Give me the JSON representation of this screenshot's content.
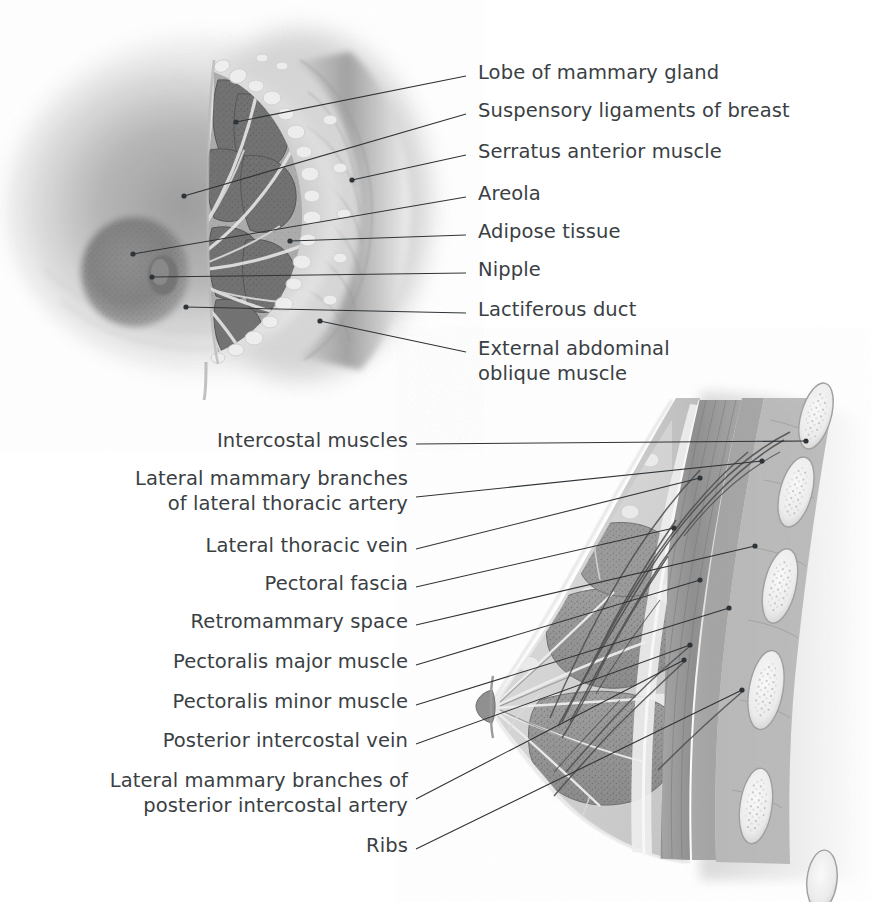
{
  "figure": {
    "style": "grayscale medical illustration",
    "background_color": "#ffffff",
    "text_color": "#3a3f44",
    "leader_color": "#2f3438"
  },
  "panels": [
    {
      "id": "anterior-dissection",
      "name": "Anterior view dissection of the breast",
      "labels": [
        {
          "text": "Lobe of mammary gland",
          "x": 478,
          "y": 60,
          "align": "left",
          "lx": 466,
          "ly": 76,
          "tx": 236,
          "ty": 122
        },
        {
          "text": "Suspensory ligaments of breast",
          "x": 478,
          "y": 98,
          "align": "left",
          "lx": 466,
          "ly": 114,
          "tx": 184,
          "ty": 196
        },
        {
          "text": "Serratus anterior muscle",
          "x": 478,
          "y": 139,
          "align": "left",
          "lx": 466,
          "ly": 155,
          "tx": 352,
          "ty": 180
        },
        {
          "text": "Areola",
          "x": 478,
          "y": 181,
          "align": "left",
          "lx": 466,
          "ly": 197,
          "tx": 133,
          "ty": 254
        },
        {
          "text": "Adipose tissue",
          "x": 478,
          "y": 219,
          "align": "left",
          "lx": 466,
          "ly": 235,
          "tx": 290,
          "ty": 241
        },
        {
          "text": "Nipple",
          "x": 478,
          "y": 257,
          "align": "left",
          "lx": 466,
          "ly": 273,
          "tx": 152,
          "ty": 277
        },
        {
          "text": "Lactiferous duct",
          "x": 478,
          "y": 297,
          "align": "left",
          "lx": 466,
          "ly": 313,
          "tx": 186,
          "ty": 307
        },
        {
          "text": "External abdominal",
          "x": 478,
          "y": 336,
          "align": "left",
          "lx": 466,
          "ly": 352,
          "tx": 320,
          "ty": 321
        },
        {
          "text": "oblique muscle",
          "x": 478,
          "y": 361,
          "align": "left"
        }
      ]
    },
    {
      "id": "sagittal-section",
      "name": "Sagittal section of the breast and chest wall",
      "labels": [
        {
          "text": "Intercostal muscles",
          "x": 408,
          "y": 428,
          "align": "right",
          "lx": 416,
          "ly": 444,
          "tx": 806,
          "ty": 441
        },
        {
          "text": "Lateral mammary branches",
          "x": 408,
          "y": 466,
          "align": "right",
          "lx": 416,
          "ly": 497,
          "tx": 762,
          "ty": 461
        },
        {
          "text": "of lateral thoracic artery",
          "x": 408,
          "y": 491,
          "align": "right"
        },
        {
          "text": "Lateral thoracic vein",
          "x": 408,
          "y": 533,
          "align": "right",
          "lx": 416,
          "ly": 549,
          "tx": 700,
          "ty": 478
        },
        {
          "text": "Pectoral fascia",
          "x": 408,
          "y": 571,
          "align": "right",
          "lx": 416,
          "ly": 587,
          "tx": 674,
          "ty": 528
        },
        {
          "text": "Retromammary space",
          "x": 408,
          "y": 609,
          "align": "right",
          "lx": 416,
          "ly": 625,
          "tx": 755,
          "ty": 546
        },
        {
          "text": "Pectoralis major muscle",
          "x": 408,
          "y": 649,
          "align": "right",
          "lx": 416,
          "ly": 665,
          "tx": 700,
          "ty": 580
        },
        {
          "text": "Pectoralis minor muscle",
          "x": 408,
          "y": 689,
          "align": "right",
          "lx": 416,
          "ly": 705,
          "tx": 729,
          "ty": 608
        },
        {
          "text": "Posterior intercostal vein",
          "x": 408,
          "y": 728,
          "align": "right",
          "lx": 416,
          "ly": 744,
          "tx": 690,
          "ty": 645
        },
        {
          "text": "Lateral mammary branches of",
          "x": 408,
          "y": 768,
          "align": "right",
          "lx": 416,
          "ly": 799,
          "tx": 684,
          "ty": 660
        },
        {
          "text": "posterior intercostal artery",
          "x": 408,
          "y": 793,
          "align": "right"
        },
        {
          "text": "Ribs",
          "x": 408,
          "y": 833,
          "align": "right",
          "lx": 416,
          "ly": 849,
          "tx": 742,
          "ty": 690
        }
      ]
    }
  ]
}
